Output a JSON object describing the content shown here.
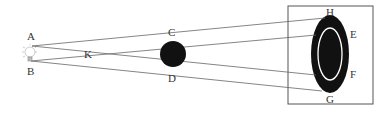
{
  "diagram": {
    "labels": {
      "A": "A",
      "B": "B",
      "C": "C",
      "D": "D",
      "E": "E",
      "F": "F",
      "G": "G",
      "H": "H",
      "K": "K"
    },
    "elements": {
      "light_source": "light-bulb",
      "obstacle": "opaque-ball",
      "screen": "screen",
      "umbra": "inner-shadow",
      "penumbra": "outer-shadow"
    },
    "colors": {
      "line": "#666666",
      "object": "#111111",
      "screen_border": "#555555",
      "label": "#333333"
    }
  }
}
